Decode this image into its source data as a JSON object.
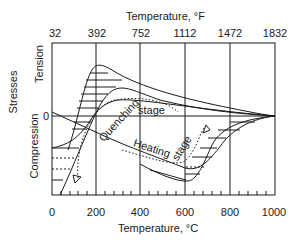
{
  "figure": {
    "top_axis": {
      "title": "Temperature, °F",
      "ticks": [
        "32",
        "392",
        "752",
        "1112",
        "1472",
        "1832"
      ]
    },
    "bottom_axis": {
      "title": "Temperature, °C",
      "ticks": [
        "0",
        "200",
        "400",
        "600",
        "800",
        "1000"
      ]
    },
    "y_axis": {
      "title": "Stresses",
      "upper_label": "Tension",
      "lower_label": "Compression",
      "zero_label": "0"
    },
    "annotations": {
      "quenching_1": "Quenching",
      "quenching_2": "stage",
      "heating_1": "Heating",
      "heating_2": "stage"
    },
    "colors": {
      "line": "#1a1a1a",
      "background": "#ffffff"
    }
  }
}
